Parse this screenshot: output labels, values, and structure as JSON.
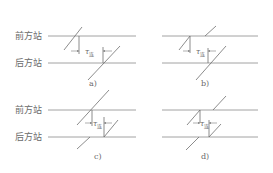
{
  "figure": {
    "stations": {
      "front": "前方站",
      "rear": "后方站"
    },
    "interval_symbol": "τ",
    "interval_subscript": "连",
    "panels": [
      {
        "id": "a",
        "caption": "a)"
      },
      {
        "id": "b",
        "caption": "b)"
      },
      {
        "id": "c",
        "caption": "c)"
      },
      {
        "id": "d",
        "caption": "d)"
      }
    ]
  },
  "colors": {
    "line": "#8a8a8a",
    "text": "#6a6a6a",
    "background": "#ffffff"
  }
}
